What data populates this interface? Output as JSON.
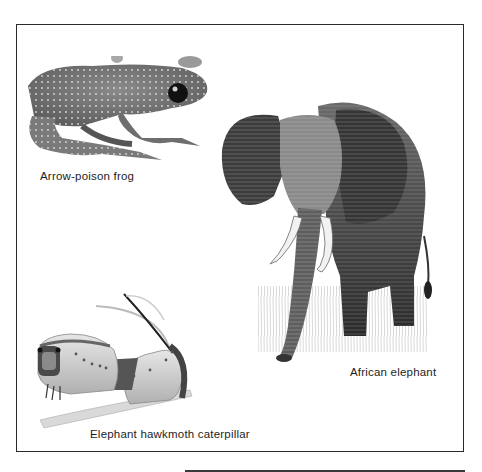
{
  "page": {
    "figures": [
      {
        "id": "frog",
        "caption": "Arrow-poison frog",
        "icon": "frog-illustration"
      },
      {
        "id": "elephant",
        "caption": "African elephant",
        "icon": "elephant-illustration"
      },
      {
        "id": "caterpillar",
        "caption": "Elephant hawkmoth caterpillar",
        "icon": "caterpillar-illustration"
      }
    ]
  },
  "colors": {
    "frame": "#2a2a2a",
    "text": "#1e1e1e",
    "background": "#ffffff"
  }
}
